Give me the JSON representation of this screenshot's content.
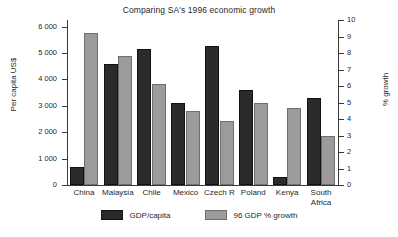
{
  "chart_data": {
    "type": "bar",
    "title": "Comparing SA's 1996 economic growth",
    "xlabel": "",
    "ylabel": "Per capita US$",
    "ylabel_right": "% growth",
    "categories": [
      "China",
      "Malaysia",
      "Chile",
      "Mexico",
      "Czech R",
      "Poland",
      "Kenya",
      "South Africa"
    ],
    "category_lines": [
      [
        "China"
      ],
      [
        "Malaysia"
      ],
      [
        "Chile"
      ],
      [
        "Mexico"
      ],
      [
        "Czech R"
      ],
      [
        "Poland"
      ],
      [
        "Kenya"
      ],
      [
        "South",
        "Africa"
      ]
    ],
    "series": [
      {
        "name": "GDP/capita",
        "axis": "left",
        "color": "#2b2b2b",
        "values": [
          700,
          4600,
          5150,
          3100,
          5250,
          3600,
          320,
          3300
        ]
      },
      {
        "name": "96 GDP % growth",
        "axis": "right",
        "color": "#9b9b9b",
        "values": [
          9.2,
          7.8,
          6.1,
          4.5,
          3.9,
          5.0,
          4.65,
          3.0
        ]
      }
    ],
    "ylim": [
      0,
      6250
    ],
    "ylim_right": [
      0,
      10
    ],
    "yticks": [
      0,
      1000,
      2000,
      3000,
      4000,
      5000,
      6000
    ],
    "ytick_labels": [
      "0",
      "1 000",
      "2 000",
      "3 000",
      "4 000",
      "5 000",
      "6 000"
    ],
    "yticks_right": [
      0,
      1,
      2,
      3,
      4,
      5,
      6,
      7,
      8,
      9,
      10
    ],
    "ytick_labels_right": [
      "0",
      "1",
      "2",
      "3",
      "4",
      "5",
      "6",
      "7",
      "8",
      "9",
      "10"
    ],
    "grid": false,
    "legend_position": "bottom"
  },
  "legend": {
    "items": [
      {
        "label": "GDP/capita"
      },
      {
        "label": "96 GDP % growth"
      }
    ]
  }
}
